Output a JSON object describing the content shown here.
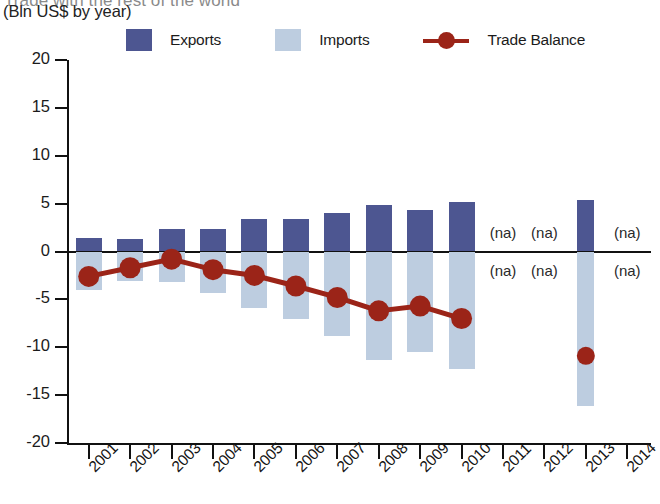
{
  "header": {
    "title_partial": "Trade with the rest of the world",
    "subtitle": "(Bln US$ by year)"
  },
  "legend": {
    "position": "top",
    "items": [
      {
        "label": "Exports",
        "type": "bar",
        "color": "#4d5691",
        "icon": "square-swatch"
      },
      {
        "label": "Imports",
        "type": "bar",
        "color": "#bdcde0",
        "icon": "square-swatch"
      },
      {
        "label": "Trade Balance",
        "type": "line",
        "color": "#9b2418",
        "icon": "line-marker-key"
      }
    ]
  },
  "axes": {
    "y_ticks": [
      "20",
      "15",
      "10",
      "5",
      "0",
      "-5",
      "-10",
      "-15",
      "-20"
    ],
    "x_ticks": [
      "2001",
      "2002",
      "2003",
      "2004",
      "2005",
      "2006",
      "2007",
      "2008",
      "2009",
      "2010",
      "2011",
      "2012",
      "2013",
      "2014"
    ]
  },
  "na_text": "(na)",
  "chart_data": {
    "type": "bar",
    "title": "Trade with the rest of the world",
    "subtitle": "(Bln US$ by year)",
    "xlabel": "",
    "ylabel": "Bln US$",
    "ylim": [
      -20,
      20
    ],
    "grid": false,
    "legend_position": "top",
    "categories": [
      "2001",
      "2002",
      "2003",
      "2004",
      "2005",
      "2006",
      "2007",
      "2008",
      "2009",
      "2010",
      "2011",
      "2012",
      "2013",
      "2014"
    ],
    "series": [
      {
        "name": "Exports",
        "type": "bar",
        "color": "#4d5691",
        "values": [
          1.4,
          1.3,
          2.4,
          2.4,
          3.4,
          3.4,
          4.0,
          4.9,
          4.3,
          5.2,
          null,
          null,
          5.4,
          null
        ]
      },
      {
        "name": "Imports",
        "type": "bar",
        "color": "#bdcde0",
        "values": [
          -4.0,
          -3.1,
          -3.2,
          -4.3,
          -5.9,
          -7.0,
          -8.8,
          -11.3,
          -10.5,
          -12.3,
          null,
          null,
          -16.1,
          null
        ]
      },
      {
        "name": "Trade Balance",
        "type": "line",
        "color": "#9b2418",
        "values": [
          -2.6,
          -1.7,
          -0.8,
          -1.9,
          -2.5,
          -3.6,
          -4.8,
          -6.2,
          -5.7,
          -7.0,
          null,
          null,
          -10.9,
          null
        ]
      }
    ],
    "missing_data_marker": "(na)",
    "missing_years": [
      "2011",
      "2012",
      "2014"
    ]
  }
}
